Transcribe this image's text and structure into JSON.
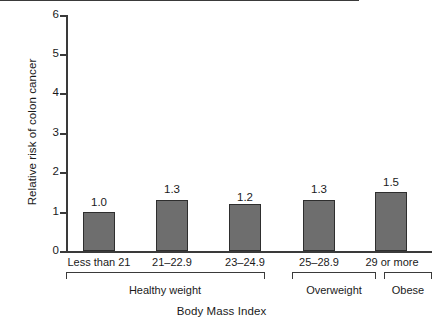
{
  "chart_data": {
    "type": "bar",
    "title": "",
    "xlabel": "Body Mass Index",
    "ylabel": "Relative risk of colon cancer",
    "categories": [
      "Less than 21",
      "21–22.9",
      "23–24.9",
      "25–28.9",
      "29 or more"
    ],
    "values": [
      1.0,
      1.3,
      1.2,
      1.3,
      1.5
    ],
    "value_labels": [
      "1.0",
      "1.3",
      "1.2",
      "1.3",
      "1.5"
    ],
    "ylim": [
      0,
      6
    ],
    "yticks": [
      0,
      1,
      2,
      3,
      4,
      5,
      6
    ],
    "ytick_labels": [
      "0",
      "1",
      "2",
      "3",
      "4",
      "5",
      "6"
    ],
    "grid": false,
    "legend": null,
    "reference_line": 1,
    "groups": [
      {
        "label": "Healthy weight",
        "categories": [
          "Less than 21",
          "21–22.9",
          "23–24.9"
        ]
      },
      {
        "label": "Overweight",
        "categories": [
          "25–28.9"
        ]
      },
      {
        "label": "Obese",
        "categories": [
          "29 or more"
        ]
      }
    ],
    "colors": {
      "bar_fill": "#6e6e6e",
      "bar_edge": "#2e2e2e",
      "axis": "#3a3a3a",
      "text": "#1a1a1a",
      "background": "#ffffff"
    }
  }
}
